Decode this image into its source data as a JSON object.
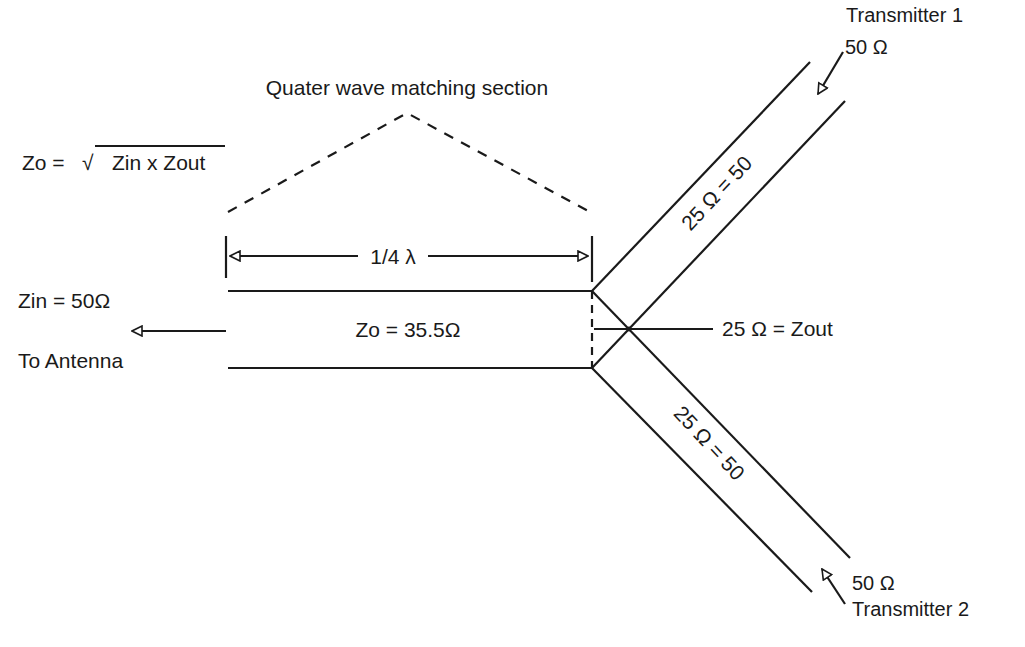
{
  "diagram": {
    "section_title": "Quater wave matching section",
    "formula": {
      "lhs": "Zo =",
      "radical": "√",
      "rhs": "Zin x Zout"
    },
    "dimension_label": "1/4 λ",
    "zin_label": "Zin = 50Ω",
    "to_antenna_label": "To Antenna",
    "zo_value_label": "Zo = 35.5Ω",
    "zout_label": "25 Ω = Zout",
    "upper_branch_label": "25 Ω = 50",
    "lower_branch_label": "25 Ω = 50",
    "transmitter_1": {
      "name": "Transmitter 1",
      "impedance": "50 Ω"
    },
    "transmitter_2": {
      "name": "Transmitter 2",
      "impedance": "50 Ω"
    },
    "colors": {
      "ink": "#1a1a1a",
      "background": "#ffffff"
    }
  }
}
